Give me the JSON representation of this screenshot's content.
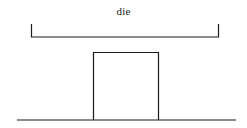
{
  "diagram": {
    "label": "die",
    "stroke_color": "#1a1a1a",
    "background": "#ffffff",
    "bracket": {
      "x1": 31.5,
      "x2": 218.5,
      "top": 24,
      "bottom": 37
    },
    "block": {
      "x": 93.5,
      "y": 52.5,
      "width": 65,
      "height": 67.5
    },
    "baseline": {
      "x1": 17,
      "x2": 236,
      "y": 120
    }
  }
}
